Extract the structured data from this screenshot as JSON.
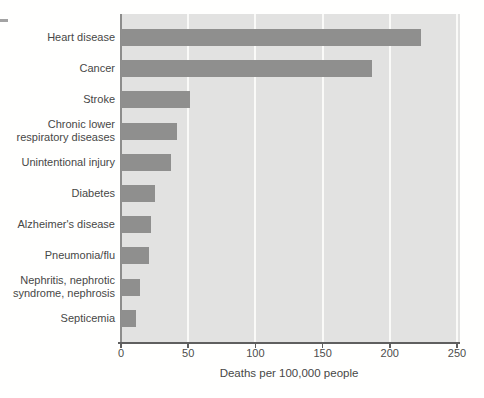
{
  "figure": {
    "background_color": "#ffffff",
    "page_margin_dash_color": "#a3a3a3"
  },
  "chart_data": {
    "type": "bar",
    "orientation": "horizontal",
    "title": "",
    "categories": [
      "Heart disease",
      "Cancer",
      "Stroke",
      "Chronic lower\nrespiratory diseases",
      "Unintentional injury",
      "Diabetes",
      "Alzheimer's disease",
      "Pneumonia/flu",
      "Nephritis, nephrotic\nsyndrome, nephrosis",
      "Septicemia"
    ],
    "values": [
      223,
      187,
      51,
      42,
      37,
      25,
      22,
      21,
      14,
      11
    ],
    "xlabel": "Deaths per 100,000 people",
    "xlim": [
      0,
      250
    ],
    "xticks": [
      0,
      50,
      100,
      150,
      200,
      250
    ],
    "xtick_labels": [
      "0",
      "50",
      "100",
      "150",
      "200",
      "250"
    ],
    "grid": "vertical gridlines at each x tick, white on gray plot background",
    "legend": "none",
    "bar_color": "#8f8f8e",
    "plot_background_color": "#e2e2e1",
    "gridline_color": "#fafaf8",
    "axis_line_color": "#5f5f5f",
    "label_text_color": "#474746"
  }
}
